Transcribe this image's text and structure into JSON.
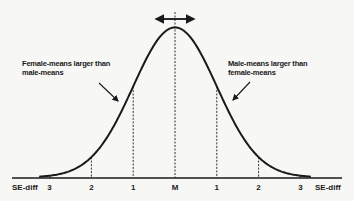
{
  "figure": {
    "cut_top_text": "ᵢᵢᵢ ᵢ ᵢᵢᵢ",
    "annotations": {
      "left": [
        "Female-means larger than",
        "male-means"
      ],
      "right": [
        "Male-means larger than",
        "female-means"
      ]
    },
    "axis": {
      "end_label_left": "SE-diff",
      "end_label_right": "SE-diff",
      "ticks": [
        {
          "label": "3",
          "sd": -3
        },
        {
          "label": "2",
          "sd": -2
        },
        {
          "label": "1",
          "sd": -1
        },
        {
          "label": "M",
          "sd": 0
        },
        {
          "label": "1",
          "sd": 1
        },
        {
          "label": "2",
          "sd": 2
        },
        {
          "label": "3",
          "sd": 3
        }
      ]
    },
    "curve": {
      "type": "normal-distribution",
      "mean": 0,
      "sd": 1,
      "range": [
        -3.25,
        3.25
      ]
    },
    "top_arrow": "double-headed horizontal arrow over mean"
  },
  "colors": {
    "ink": "#1a1a1a",
    "background": "#f7f7f5"
  }
}
